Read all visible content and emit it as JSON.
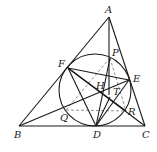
{
  "figure": {
    "width": 157,
    "height": 152,
    "points": {
      "A": {
        "x": 109,
        "y": 17,
        "label": "A",
        "lx": 105,
        "ly": 13
      },
      "B": {
        "x": 19,
        "y": 126,
        "label": "B",
        "lx": 14,
        "ly": 138
      },
      "C": {
        "x": 145,
        "y": 126,
        "label": "C",
        "lx": 142,
        "ly": 138
      },
      "D": {
        "x": 96,
        "y": 126,
        "label": "D",
        "lx": 93,
        "ly": 138
      },
      "E": {
        "x": 129,
        "y": 80,
        "label": "E",
        "lx": 133,
        "ly": 82
      },
      "F": {
        "x": 68,
        "y": 68,
        "label": "F",
        "lx": 58,
        "ly": 67
      },
      "P": {
        "x": 110,
        "y": 58,
        "label": "P",
        "lx": 112,
        "ly": 56
      },
      "H": {
        "x": 103,
        "y": 93,
        "label": "H",
        "lx": 96,
        "ly": 89
      },
      "T": {
        "x": 110,
        "y": 97,
        "label": "T",
        "lx": 113,
        "ly": 95
      },
      "Q": {
        "x": 66,
        "y": 110,
        "label": "Q",
        "lx": 60,
        "ly": 121
      },
      "R": {
        "x": 126,
        "y": 111,
        "label": "R",
        "lx": 128,
        "ly": 115
      }
    },
    "circle": {
      "cx": 95,
      "cy": 90,
      "r": 36
    },
    "solid_lines": [
      [
        "A",
        "B"
      ],
      [
        "A",
        "C"
      ],
      [
        "B",
        "C"
      ],
      [
        "B",
        "E"
      ],
      [
        "C",
        "F"
      ],
      [
        "F",
        "E"
      ],
      [
        "F",
        "D"
      ],
      [
        "D",
        "E"
      ],
      [
        "F",
        "R"
      ],
      [
        "D",
        "P"
      ],
      [
        "D",
        "T"
      ]
    ],
    "vertical_from_A": {
      "x1": 109,
      "y1": 17,
      "x2": 109,
      "y2": 95
    },
    "dashed_lines": [
      [
        "Q",
        "R"
      ],
      [
        "Q",
        "P"
      ],
      [
        "P",
        "R"
      ]
    ]
  }
}
